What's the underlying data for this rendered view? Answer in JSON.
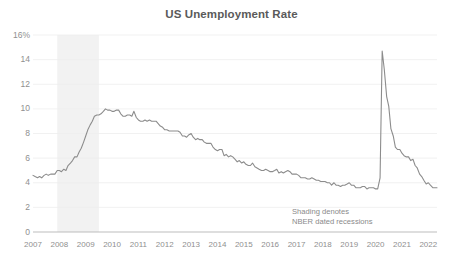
{
  "chart_data": {
    "type": "line",
    "title": "US Unemployment Rate",
    "xlabel": "",
    "ylabel": "",
    "ylim": [
      0,
      16
    ],
    "xlim": [
      2007.0,
      2022.33
    ],
    "grid": true,
    "grid_axis": "y",
    "legend": "none",
    "y_unit": "%",
    "y_ticks": [
      0,
      2,
      4,
      6,
      8,
      10,
      12,
      14,
      16
    ],
    "y_tick_labels": [
      "0",
      "2",
      "4",
      "6",
      "8",
      "10",
      "12",
      "14",
      "16%"
    ],
    "x_ticks": [
      2007,
      2008,
      2009,
      2010,
      2011,
      2012,
      2013,
      2014,
      2015,
      2016,
      2017,
      2018,
      2019,
      2020,
      2021,
      2022
    ],
    "x_tick_labels": [
      "2007",
      "2008",
      "2009",
      "2010",
      "2011",
      "2012",
      "2013",
      "2014",
      "2015",
      "2016",
      "2017",
      "2018",
      "2019",
      "2020",
      "2021",
      "2022"
    ],
    "line_color": "#8c8c8c",
    "line_width": 1.1,
    "shading_color": "#f2f2f2",
    "annotations": [
      {
        "text_line1": "Shading denotes",
        "text_line2": "NBER dated recessions"
      }
    ],
    "shaded_regions": [
      {
        "label": "NBER dated recession",
        "start": 2007.92,
        "end": 2009.5
      }
    ],
    "series": [
      {
        "name": "US Unemployment Rate",
        "x": [
          2007.0,
          2007.08,
          2007.17,
          2007.25,
          2007.33,
          2007.42,
          2007.5,
          2007.58,
          2007.67,
          2007.75,
          2007.83,
          2007.92,
          2008.0,
          2008.08,
          2008.17,
          2008.25,
          2008.33,
          2008.42,
          2008.5,
          2008.58,
          2008.67,
          2008.75,
          2008.83,
          2008.92,
          2009.0,
          2009.08,
          2009.17,
          2009.25,
          2009.33,
          2009.42,
          2009.5,
          2009.58,
          2009.67,
          2009.75,
          2009.83,
          2009.92,
          2010.0,
          2010.08,
          2010.17,
          2010.25,
          2010.33,
          2010.42,
          2010.5,
          2010.58,
          2010.67,
          2010.75,
          2010.83,
          2010.92,
          2011.0,
          2011.08,
          2011.17,
          2011.25,
          2011.33,
          2011.42,
          2011.5,
          2011.58,
          2011.67,
          2011.75,
          2011.83,
          2011.92,
          2012.0,
          2012.08,
          2012.17,
          2012.25,
          2012.33,
          2012.42,
          2012.5,
          2012.58,
          2012.67,
          2012.75,
          2012.83,
          2012.92,
          2013.0,
          2013.08,
          2013.17,
          2013.25,
          2013.33,
          2013.42,
          2013.5,
          2013.58,
          2013.67,
          2013.75,
          2013.83,
          2013.92,
          2014.0,
          2014.08,
          2014.17,
          2014.25,
          2014.33,
          2014.42,
          2014.5,
          2014.58,
          2014.67,
          2014.75,
          2014.83,
          2014.92,
          2015.0,
          2015.08,
          2015.17,
          2015.25,
          2015.33,
          2015.42,
          2015.5,
          2015.58,
          2015.67,
          2015.75,
          2015.83,
          2015.92,
          2016.0,
          2016.08,
          2016.17,
          2016.25,
          2016.33,
          2016.42,
          2016.5,
          2016.58,
          2016.67,
          2016.75,
          2016.83,
          2016.92,
          2017.0,
          2017.08,
          2017.17,
          2017.25,
          2017.33,
          2017.42,
          2017.5,
          2017.58,
          2017.67,
          2017.75,
          2017.83,
          2017.92,
          2018.0,
          2018.08,
          2018.17,
          2018.25,
          2018.33,
          2018.42,
          2018.5,
          2018.58,
          2018.67,
          2018.75,
          2018.83,
          2018.92,
          2019.0,
          2019.08,
          2019.17,
          2019.25,
          2019.33,
          2019.42,
          2019.5,
          2019.58,
          2019.67,
          2019.75,
          2019.83,
          2019.92,
          2020.0,
          2020.08,
          2020.17,
          2020.25,
          2020.33,
          2020.42,
          2020.5,
          2020.58,
          2020.67,
          2020.75,
          2020.83,
          2020.92,
          2021.0,
          2021.08,
          2021.17,
          2021.25,
          2021.33,
          2021.42,
          2021.5,
          2021.58,
          2021.67,
          2021.75,
          2021.83,
          2021.92,
          2022.0,
          2022.08,
          2022.17,
          2022.25,
          2022.33
        ],
        "values": [
          4.6,
          4.5,
          4.4,
          4.5,
          4.4,
          4.6,
          4.7,
          4.6,
          4.7,
          4.7,
          4.7,
          5.0,
          5.0,
          4.9,
          5.1,
          5.0,
          5.4,
          5.6,
          5.8,
          6.1,
          6.1,
          6.5,
          6.8,
          7.3,
          7.8,
          8.3,
          8.7,
          9.0,
          9.4,
          9.5,
          9.5,
          9.6,
          9.8,
          10.0,
          9.9,
          9.9,
          9.8,
          9.8,
          9.9,
          9.9,
          9.6,
          9.4,
          9.4,
          9.5,
          9.5,
          9.4,
          9.8,
          9.3,
          9.1,
          9.0,
          9.0,
          9.1,
          9.0,
          9.1,
          9.0,
          9.0,
          9.0,
          8.8,
          8.6,
          8.5,
          8.3,
          8.3,
          8.2,
          8.2,
          8.2,
          8.2,
          8.2,
          8.1,
          7.8,
          7.8,
          7.7,
          7.9,
          8.0,
          7.7,
          7.5,
          7.6,
          7.5,
          7.5,
          7.3,
          7.2,
          7.2,
          7.2,
          6.9,
          6.7,
          6.6,
          6.7,
          6.7,
          6.2,
          6.3,
          6.1,
          6.2,
          6.1,
          5.9,
          5.7,
          5.8,
          5.6,
          5.7,
          5.5,
          5.4,
          5.4,
          5.6,
          5.3,
          5.2,
          5.1,
          5.0,
          5.0,
          5.1,
          5.0,
          4.9,
          4.9,
          5.0,
          5.1,
          4.8,
          4.9,
          4.8,
          4.9,
          5.0,
          4.9,
          4.7,
          4.7,
          4.7,
          4.6,
          4.4,
          4.4,
          4.4,
          4.3,
          4.3,
          4.4,
          4.3,
          4.2,
          4.2,
          4.1,
          4.1,
          4.1,
          4.0,
          4.0,
          3.8,
          4.0,
          3.8,
          3.8,
          3.7,
          3.8,
          3.8,
          3.9,
          4.0,
          3.8,
          3.8,
          3.6,
          3.6,
          3.6,
          3.7,
          3.7,
          3.5,
          3.6,
          3.6,
          3.6,
          3.5,
          3.5,
          4.4,
          14.7,
          13.2,
          11.0,
          10.2,
          8.4,
          7.8,
          6.9,
          6.7,
          6.7,
          6.4,
          6.2,
          6.1,
          6.1,
          5.8,
          5.9,
          5.4,
          5.2,
          4.7,
          4.5,
          4.2,
          3.9,
          4.0,
          3.8,
          3.6,
          3.6,
          3.6
        ]
      }
    ]
  }
}
